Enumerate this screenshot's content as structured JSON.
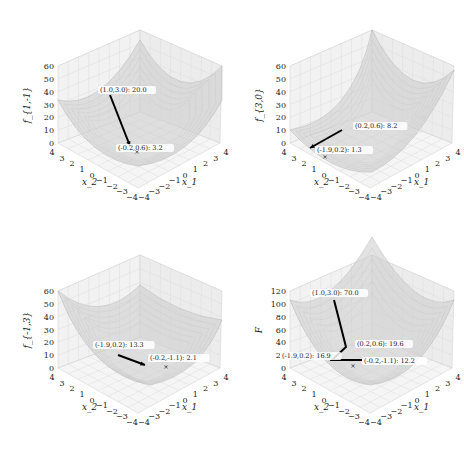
{
  "chart_data": [
    {
      "type": "surface3d",
      "zlabel": "f_{1,-1}",
      "xlabel": "x_1",
      "ylabel": "x_2",
      "xticks": [
        "-4",
        "-3",
        "-2",
        "-1",
        "0",
        "1",
        "2",
        "3",
        "4"
      ],
      "yticks": [
        "-4",
        "-3",
        "-2",
        "-1",
        "0",
        "1",
        "2",
        "3",
        "4"
      ],
      "zticks": [
        "0",
        "10",
        "20",
        "30",
        "40",
        "50",
        "60"
      ],
      "zlim": [
        0,
        60
      ],
      "minimum_marker": "x",
      "path": [
        {
          "label": "(1.0,3.0): 20.0"
        },
        {
          "label": "(-0.2,0.6): 3.2"
        }
      ]
    },
    {
      "type": "surface3d",
      "zlabel": "f_{3,0}",
      "xlabel": "x_1",
      "ylabel": "x_2",
      "xticks": [
        "-4",
        "-3",
        "-2",
        "-1",
        "0",
        "1",
        "2",
        "3",
        "4"
      ],
      "yticks": [
        "-4",
        "-3",
        "-2",
        "-1",
        "0",
        "1",
        "2",
        "3",
        "4"
      ],
      "zticks": [
        "0",
        "10",
        "20",
        "30",
        "40",
        "50",
        "60"
      ],
      "zlim": [
        0,
        60
      ],
      "minimum_marker": "x",
      "path": [
        {
          "label": "(0.2,0.6): 8.2"
        },
        {
          "label": "(-1.9,0.2): 1.3"
        }
      ]
    },
    {
      "type": "surface3d",
      "zlabel": "f_{-1,3}",
      "xlabel": "x_1",
      "ylabel": "x_2",
      "xticks": [
        "-4",
        "-3",
        "-2",
        "-1",
        "0",
        "1",
        "2",
        "3",
        "4"
      ],
      "yticks": [
        "-4",
        "-3",
        "-2",
        "-1",
        "0",
        "1",
        "2",
        "3",
        "4"
      ],
      "zticks": [
        "0",
        "10",
        "20",
        "30",
        "40",
        "50",
        "60"
      ],
      "zlim": [
        0,
        60
      ],
      "minimum_marker": "x",
      "path": [
        {
          "label": "(-1.9,0.2): 13.3"
        },
        {
          "label": "(-0.2,-1.1): 2.1"
        }
      ]
    },
    {
      "type": "surface3d",
      "zlabel": "F",
      "xlabel": "x_1",
      "ylabel": "x_2",
      "xticks": [
        "-4",
        "-3",
        "-2",
        "-1",
        "0",
        "1",
        "2",
        "3",
        "4"
      ],
      "yticks": [
        "-4",
        "-3",
        "-2",
        "-1",
        "0",
        "1",
        "2",
        "3",
        "4"
      ],
      "zticks": [
        "0",
        "20",
        "40",
        "60",
        "80",
        "100",
        "120"
      ],
      "zlim": [
        0,
        120
      ],
      "minimum_marker": "x",
      "path": [
        {
          "label": "(1.0,3.0): 70.0"
        },
        {
          "label": "(0.2,0.6): 19.6"
        },
        {
          "label": "(-1.9,0.2): 16.9"
        },
        {
          "label": "(-0.2,-1.1): 12.2"
        }
      ]
    }
  ]
}
